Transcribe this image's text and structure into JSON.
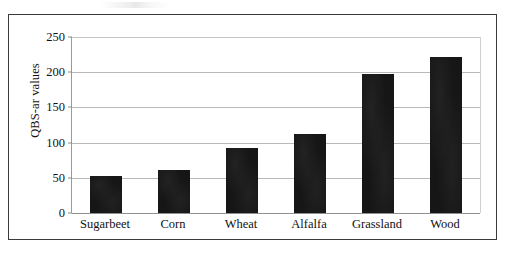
{
  "chart_data": {
    "type": "bar",
    "title": "",
    "subtitle": "",
    "xlabel": "",
    "ylabel": "QBS-ar values",
    "categories": [
      "Sugarbeet",
      "Corn",
      "Wheat",
      "Alfalfa",
      "Grassland",
      "Wood"
    ],
    "values": [
      53,
      61,
      92,
      112,
      198,
      222
    ],
    "series": [
      {
        "name": "QBS-ar",
        "values": [
          53,
          61,
          92,
          112,
          198,
          222
        ]
      }
    ],
    "ylim": [
      0,
      250
    ],
    "ytick_labels": [
      "0",
      "50",
      "100",
      "150",
      "200",
      "250"
    ],
    "ytick_values": [
      0,
      50,
      100,
      150,
      200,
      250
    ],
    "grid": "horizontal",
    "legend": "none",
    "bar_color": "#161616",
    "gridline_color": "#b9b9b9",
    "axis_color": "#8f8f8f",
    "frame_color": "#3b3b3b"
  },
  "axes": {
    "y_title": "QBS-ar values"
  }
}
